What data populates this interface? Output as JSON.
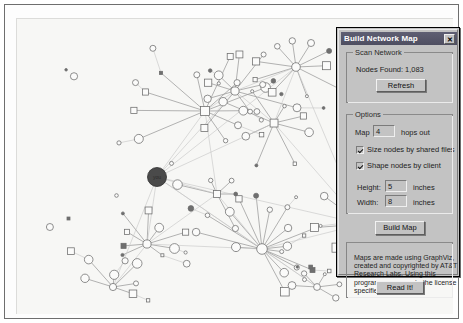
{
  "window": {
    "background_color": "#ffffff",
    "canvas_color": "#f7f7f5"
  },
  "dialog": {
    "title": "Build Network Map",
    "close_label": "✕",
    "scan_group": {
      "title": "Scan Network",
      "nodes_found_label": "Nodes Found:",
      "nodes_found_value": "1,083",
      "refresh_label": "Refresh"
    },
    "options_group": {
      "title": "Options",
      "map_label": "Map",
      "hops_value": "4",
      "hops_suffix": "hops out",
      "size_nodes_label": "Size nodes by shared files",
      "size_nodes_checked": true,
      "shape_nodes_label": "Shape nodes by client",
      "shape_nodes_checked": true,
      "height_label": "Height:",
      "height_value": "5",
      "height_units": "inches",
      "width_label": "Width:",
      "width_value": "8",
      "width_units": "inches"
    },
    "build_map_label": "Build Map",
    "license": {
      "text": "Maps are made using GraphViz, created and copyrighted by AT&T Research Labs.  Using this program you agree to the license specified by them.",
      "read_it_label": "Read It!"
    }
  },
  "graph": {
    "node_stroke_color": "#6b6b6b",
    "edge_color": "#9a9a9a",
    "root_node_color": "#4a4a4a",
    "root_node_label": "you"
  }
}
